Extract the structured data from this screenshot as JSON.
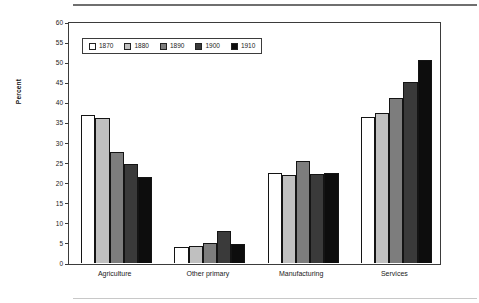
{
  "chart_data": {
    "type": "bar",
    "title": "",
    "xlabel": "",
    "ylabel": "Percent",
    "ylim": [
      0,
      60
    ],
    "ytick_step": 5,
    "yticks": [
      0,
      5,
      10,
      15,
      20,
      25,
      30,
      35,
      40,
      45,
      50,
      55,
      60
    ],
    "grid": false,
    "legend_position": "upper-left-inside",
    "categories": [
      "Agriculture",
      "Other primary",
      "Manufacturing",
      "Services"
    ],
    "series": [
      {
        "name": "1870",
        "color": "#ffffff",
        "values": [
          36.9,
          4.0,
          22.5,
          36.4
        ]
      },
      {
        "name": "1880",
        "color": "#c0c0c0",
        "values": [
          36.0,
          4.2,
          22.0,
          37.4
        ]
      },
      {
        "name": "1890",
        "color": "#7d7d7d",
        "values": [
          27.7,
          4.9,
          25.3,
          41.2
        ]
      },
      {
        "name": "1900",
        "color": "#3a3a3a",
        "values": [
          24.6,
          8.0,
          22.2,
          45.0
        ]
      },
      {
        "name": "1910",
        "color": "#0d0d0d",
        "values": [
          21.3,
          4.8,
          22.5,
          50.6
        ]
      }
    ]
  },
  "figure": {
    "axis_color": "#3b3b3b",
    "bar_edge_color": "#141414",
    "rule_top_color": "#6f6f6f",
    "rule_bottom_color": "#c8c8c8"
  }
}
